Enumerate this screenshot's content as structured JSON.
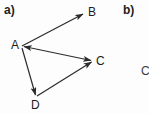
{
  "figure": {
    "parts": [
      {
        "id": "a",
        "label": "a)"
      },
      {
        "id": "b",
        "label": "b)"
      }
    ],
    "partial_right_label": "C"
  },
  "diagram": {
    "type": "vector-diagram",
    "stroke_color": "#2b2b2b",
    "background_color": "#fdfdfd",
    "points": [
      {
        "name": "A",
        "label": "A",
        "x": 22,
        "y": 46
      },
      {
        "name": "B",
        "label": "B",
        "x": 85,
        "y": 13
      },
      {
        "name": "C",
        "label": "C",
        "x": 93,
        "y": 61
      },
      {
        "name": "D",
        "label": "D",
        "x": 36,
        "y": 97
      }
    ],
    "vectors": [
      {
        "name": "AB",
        "from": "A",
        "to": "B",
        "arrow_at": "to"
      },
      {
        "name": "AC",
        "from": "A",
        "to": "C",
        "arrow_at": "both"
      },
      {
        "name": "AD",
        "from": "A",
        "to": "D",
        "arrow_at": "to"
      },
      {
        "name": "DC",
        "from": "D",
        "to": "C",
        "arrow_at": "to"
      }
    ]
  }
}
